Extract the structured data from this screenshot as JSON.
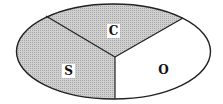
{
  "diagram": {
    "shape": "ellipse",
    "regions": [
      {
        "id": "S",
        "label": "S",
        "fill": "#c4c4c4",
        "position": "left"
      },
      {
        "id": "C",
        "label": "C",
        "fill": "#c4c4c4",
        "position": "top"
      },
      {
        "id": "O",
        "label": "O",
        "fill": "#ffffff",
        "position": "bottom-right"
      }
    ],
    "stroke_color": "#222222"
  }
}
